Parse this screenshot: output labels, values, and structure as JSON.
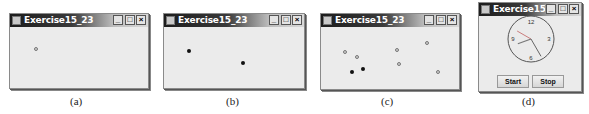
{
  "windows": [
    {
      "id": "a",
      "title": "Exercise15_23",
      "caption": "(a)",
      "controls": {
        "minimize": "_",
        "maximize": "□",
        "close": "×"
      },
      "points": [
        {
          "x": 26,
          "y": 22,
          "style": "hollow"
        }
      ]
    },
    {
      "id": "b",
      "title": "Exercise15_23",
      "caption": "(b)",
      "controls": {
        "minimize": "_",
        "maximize": "□",
        "close": "×"
      },
      "points": [
        {
          "x": 25,
          "y": 24,
          "style": "filled"
        },
        {
          "x": 79,
          "y": 36,
          "style": "filled"
        }
      ]
    },
    {
      "id": "c",
      "title": "Exercise15_23",
      "caption": "(c)",
      "controls": {
        "minimize": "_",
        "maximize": "□",
        "close": "×"
      },
      "points": [
        {
          "x": 24,
          "y": 25,
          "style": "hollow"
        },
        {
          "x": 36,
          "y": 30,
          "style": "hollow"
        },
        {
          "x": 76,
          "y": 23,
          "style": "hollow"
        },
        {
          "x": 106,
          "y": 16,
          "style": "hollow"
        },
        {
          "x": 78,
          "y": 37,
          "style": "hollow"
        },
        {
          "x": 117,
          "y": 45,
          "style": "hollow"
        },
        {
          "x": 31,
          "y": 45,
          "style": "filled"
        },
        {
          "x": 42,
          "y": 42,
          "style": "filled"
        }
      ]
    },
    {
      "id": "d",
      "title": "Exercise15_24",
      "caption": "(d)",
      "controls": {
        "minimize": "_",
        "maximize": "□",
        "close": "×"
      },
      "clock": {
        "labels": {
          "top": "12",
          "right": "3",
          "bottom": "6",
          "left": "9"
        },
        "hour_hand_angle": 250,
        "minute_hand_angle": 150,
        "second_hand_angle": 300
      },
      "buttons": {
        "start": "Start",
        "stop": "Stop"
      }
    }
  ]
}
